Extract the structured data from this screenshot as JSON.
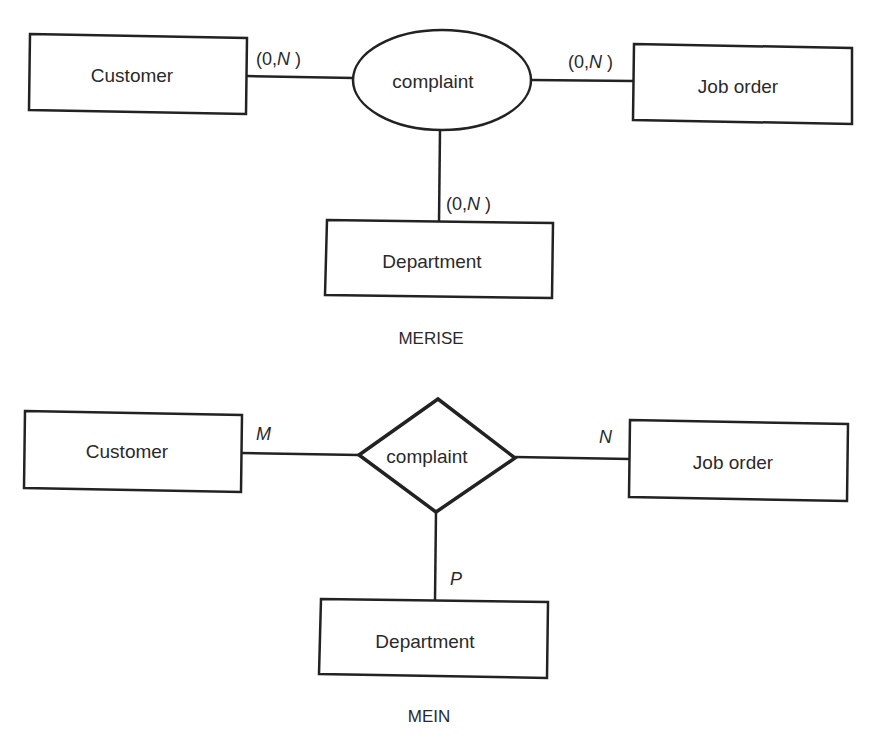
{
  "merise": {
    "caption": "MERISE",
    "relationship": "complaint",
    "entities": {
      "customer": "Customer",
      "job_order": "Job order",
      "department": "Department"
    },
    "cardinalities": {
      "customer_pre": "(0,",
      "customer_n": "N",
      "customer_post": " )",
      "job_order_pre": "(0,",
      "job_order_n": "N",
      "job_order_post": " )",
      "department_pre": "(0,",
      "department_n": "N",
      "department_post": " )"
    }
  },
  "mein": {
    "caption": "MEIN",
    "relationship": "complaint",
    "entities": {
      "customer": "Customer",
      "job_order": "Job order",
      "department": "Department"
    },
    "cardinalities": {
      "customer": "M",
      "job_order": "N",
      "department": "P"
    }
  }
}
